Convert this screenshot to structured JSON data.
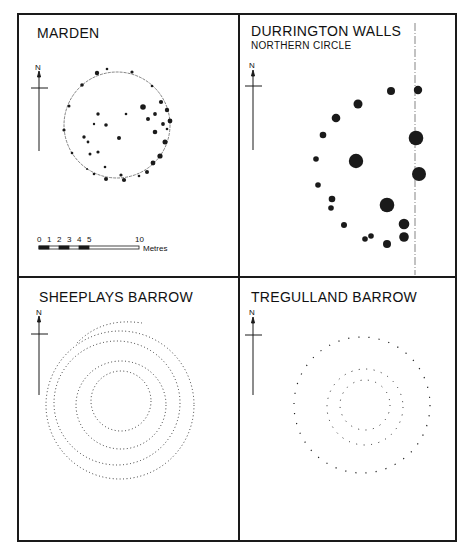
{
  "panels": [
    {
      "id": "marden",
      "title": "MARDEN",
      "subtitle": ""
    },
    {
      "id": "durrington",
      "title": "DURRINGTON WALLS",
      "subtitle": "NORTHERN CIRCLE"
    },
    {
      "id": "sheeplays",
      "title": "SHEEPLAYS BARROW",
      "subtitle": ""
    },
    {
      "id": "tregulland",
      "title": "TREGULLAND BARROW",
      "subtitle": ""
    }
  ],
  "north_label": "N",
  "scale_bar": {
    "ticks": [
      "0",
      "1",
      "2",
      "3",
      "4",
      "5",
      "10"
    ],
    "unit": "Metres"
  },
  "colors": {
    "ink": "#1a1a1a",
    "paper": "#ffffff"
  }
}
